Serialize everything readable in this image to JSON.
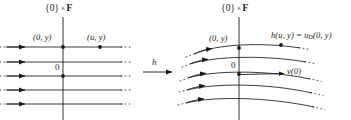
{
  "figure": {
    "background_color": "#ffffff",
    "ink_color": "#1a1a1a",
    "width": 351,
    "height": 120
  },
  "left_panel": {
    "axis_label": {
      "brace_open": "{",
      "zero": "0",
      "brace_close": "}",
      "times": "×",
      "fiber": "F",
      "full_text": "{0} × F"
    },
    "origin_label": "0",
    "point_labels": [
      {
        "name": "origin-fiber-point",
        "text": "(0, y)"
      },
      {
        "name": "u-fiber-point",
        "text": "(u, y)"
      }
    ],
    "flow_lines": 5,
    "line_style": "straight-horizontal-with-arrowheads"
  },
  "map_arrow": {
    "label": "h",
    "direction": "right"
  },
  "right_panel": {
    "axis_label": {
      "brace_open": "{",
      "zero": "0",
      "brace_close": "}",
      "times": "×",
      "fiber": "F",
      "full_text": "{0} × F"
    },
    "origin_label": "0",
    "point_labels": [
      {
        "name": "origin-fiber-point",
        "text": "(0, y)"
      },
      {
        "name": "image-point",
        "text": "h(u, y) = u",
        "subscript": "D",
        "tail": "(0, y)"
      }
    ],
    "vector_label": "v(0)",
    "flow_lines": 5,
    "line_style": "curved-flow-with-arrowheads"
  }
}
